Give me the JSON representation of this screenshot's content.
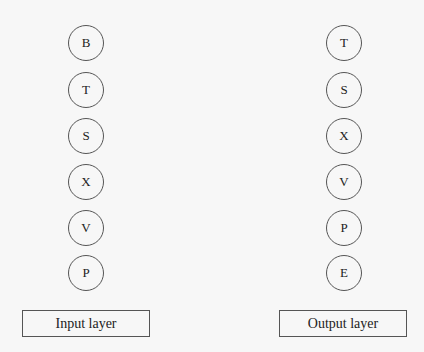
{
  "diagram": {
    "input_layer": {
      "label": "Input layer",
      "nodes": [
        "B",
        "T",
        "S",
        "X",
        "V",
        "P"
      ]
    },
    "output_layer": {
      "label": "Output layer",
      "nodes": [
        "T",
        "S",
        "X",
        "V",
        "P",
        "E"
      ]
    }
  }
}
